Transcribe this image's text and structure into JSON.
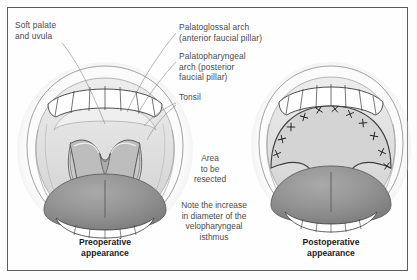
{
  "figure": {
    "frame_color": "#5b5b5b",
    "background_color": "#fefefe",
    "text_color": "#4a4a4a",
    "caption_color": "#1c1c1c",
    "tongue_color": "#8e8e8e",
    "mucosa_color": "#d9d9d9"
  },
  "labels": {
    "soft_palate": "Soft palate\nand uvula",
    "palatoglossal": "Palatoglossal arch\n(anterior faucial pillar)",
    "palatopharyngeal": "Palatopharyngeal\narch (posterior\nfaucial pillar)",
    "tonsil": "Tonsil"
  },
  "annotations": {
    "area_to_be_resected": "Area\nto be\nresected",
    "note": "Note the increase\nin diameter of the\nvelopharyngeal\nisthmus"
  },
  "captions": {
    "preoperative": "Preoperative\nappearance",
    "postoperative": "Postoperative\nappearance"
  },
  "diagram_parts": {
    "left_panel": "preoperative-oral-cavity",
    "right_panel": "postoperative-oral-cavity",
    "upper_teeth": "upper-dental-arch",
    "lower_teeth": "lower-dental-arch",
    "tongue": "tongue",
    "uvula": "uvula",
    "sutures": "suture-marks"
  }
}
